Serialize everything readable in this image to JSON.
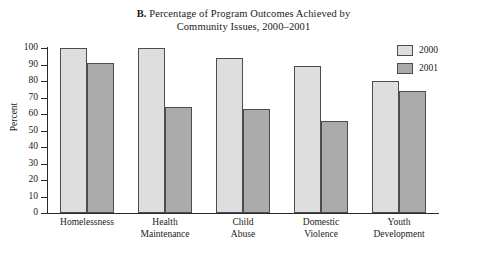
{
  "chart_data": {
    "type": "bar",
    "title_prefix": "B.",
    "title_line_1": " Percentage of Program Outcomes Achieved by",
    "title_line_2": "Community Issues, 2000–2001",
    "xlabel": "",
    "ylabel": "Percent",
    "ylim": [
      0,
      100
    ],
    "ytick_labels": [
      "100",
      "90",
      "80",
      "70",
      "60",
      "50",
      "40",
      "30",
      "20",
      "10",
      "0"
    ],
    "ytick_values": [
      100,
      90,
      80,
      70,
      60,
      50,
      40,
      30,
      20,
      10,
      0
    ],
    "grid": false,
    "legend_position": "right-top",
    "categories": [
      "Homelessness",
      "Health Maintenance",
      "Child Abuse",
      "Domestic Violence",
      "Youth Development"
    ],
    "category_lines": [
      [
        "Homelessness"
      ],
      [
        "Health",
        "Maintenance"
      ],
      [
        "Child",
        "Abuse"
      ],
      [
        "Domestic",
        "Violence"
      ],
      [
        "Youth",
        "Development"
      ]
    ],
    "series": [
      {
        "name": "2000",
        "color": "#dedede",
        "values": [
          100,
          100,
          94,
          89,
          80
        ]
      },
      {
        "name": "2001",
        "color": "#ababab",
        "values": [
          91,
          64,
          63,
          56,
          74
        ]
      }
    ]
  },
  "legend": {
    "items": [
      {
        "label": "2000",
        "color": "#dedede"
      },
      {
        "label": "2001",
        "color": "#ababab"
      }
    ]
  }
}
